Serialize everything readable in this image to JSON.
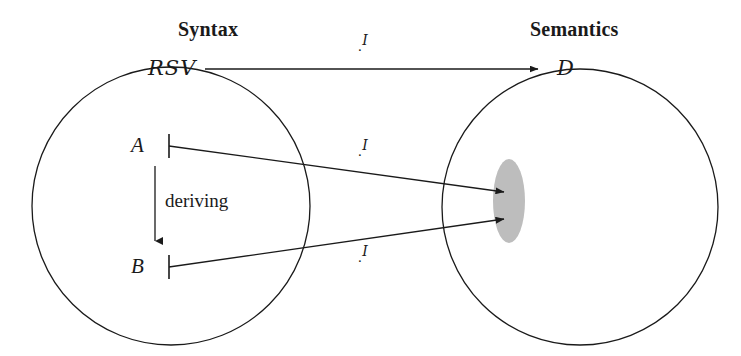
{
  "diagram": {
    "canvas": {
      "width": 741,
      "height": 356
    },
    "colors": {
      "stroke": "#1a1a1a",
      "text": "#1a1a1a",
      "ellipse_fill": "#bdbdbd",
      "background": "#ffffff"
    },
    "headings": {
      "left": "Syntax",
      "right": "Semantics"
    },
    "nodes": {
      "syntax_set": "RSV",
      "semantics_set": "D",
      "term_a": "A",
      "term_b": "B"
    },
    "edge_labels": {
      "top": {
        "dot": ".",
        "superscript": "I"
      },
      "middle": {
        "dot": ".",
        "superscript": "I"
      },
      "bottom": {
        "dot": ".",
        "superscript": "I"
      }
    },
    "derivation_label": "deriving",
    "regions": [
      {
        "name": "syntax-circle",
        "cx": 171,
        "cy": 206,
        "r": 139
      },
      {
        "name": "semantics-circle",
        "cx": 580,
        "cy": 207,
        "r": 138
      },
      {
        "name": "denotation-ellipse",
        "cx": 509,
        "cy": 201,
        "rx": 16,
        "ry": 42
      }
    ],
    "arrows": [
      {
        "name": "rsv-to-d",
        "x1": 205,
        "y1": 69,
        "x2": 540,
        "y2": 69
      },
      {
        "name": "a-to-denotation",
        "x1": 177,
        "y1": 147,
        "x2": 506,
        "y2": 192
      },
      {
        "name": "b-to-denotation",
        "x1": 177,
        "y1": 267,
        "x2": 506,
        "y2": 218
      },
      {
        "name": "deriving-a-to-b",
        "x1": 155,
        "y1": 166,
        "x2": 155,
        "y2": 247
      }
    ]
  }
}
